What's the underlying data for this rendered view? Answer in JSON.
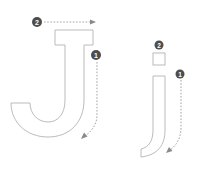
{
  "diagram": {
    "title": "",
    "colors": {
      "outline": "#b3b3b3",
      "guide": "#9a9a9a",
      "badge": "#4d4d4d",
      "badge_text": "#ffffff",
      "background": "#ffffff"
    },
    "letters": [
      {
        "glyph": "J",
        "case": "uppercase",
        "strokes": [
          {
            "order": "1",
            "description": "down and curve left"
          },
          {
            "order": "2",
            "description": "top bar left to right"
          }
        ]
      },
      {
        "glyph": "j",
        "case": "lowercase",
        "strokes": [
          {
            "order": "1",
            "description": "down and curve left"
          },
          {
            "order": "2",
            "description": "dot"
          }
        ]
      }
    ]
  }
}
